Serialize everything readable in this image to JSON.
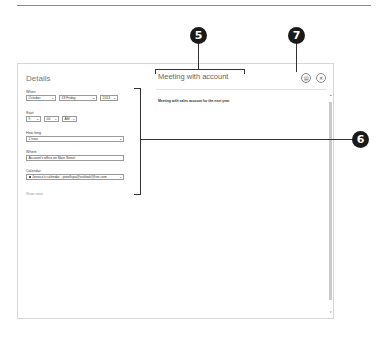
{
  "dialog": {
    "details": {
      "title": "Details",
      "when": {
        "label": "When",
        "month": "October",
        "day": "18 Friday",
        "year": "2013"
      },
      "start": {
        "label": "Start",
        "hour": "9",
        "minute": "00",
        "ampm": "AM"
      },
      "how_long": {
        "label": "How long",
        "value": "1 hour"
      },
      "where": {
        "label": "Where",
        "value": "Account's office on Main Street"
      },
      "calendar": {
        "label": "Calendar",
        "value": "Jessica's calendar - ipwellspa@outlook@live.com"
      },
      "show_more": "Show more"
    },
    "editor": {
      "title": "Meeting with account",
      "description": "Meeting with sales account for the next year",
      "save_icon": "save-icon",
      "close_icon": "close-icon"
    }
  },
  "callouts": [
    {
      "number": "5",
      "target": "event-title"
    },
    {
      "number": "7",
      "target": "save-button"
    },
    {
      "number": "6",
      "target": "details-fields"
    }
  ],
  "colors": {
    "callout_bg": "#1a1a1a",
    "border": "#d6d6d6",
    "scroll_thumb": "#c9c9c9"
  }
}
